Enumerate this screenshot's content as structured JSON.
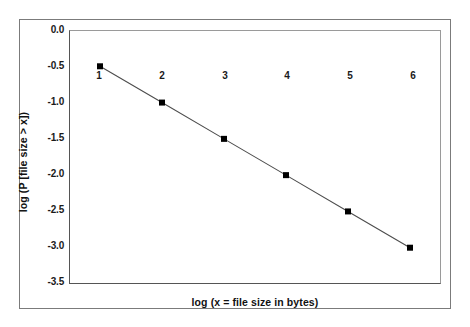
{
  "chart_data": {
    "type": "line",
    "title": "",
    "xlabel": "log (x = file size in bytes)",
    "ylabel": "log (P [file size > x])",
    "x": [
      1,
      2,
      3,
      4,
      5,
      6
    ],
    "values": [
      -0.5,
      -1.0,
      -1.5,
      -2.0,
      -2.5,
      -3.0
    ],
    "series": [
      {
        "name": "log complementary CDF of file size",
        "values": [
          -0.5,
          -1.0,
          -1.5,
          -2.0,
          -2.5,
          -3.0
        ]
      }
    ],
    "xlim": [
      0.5,
      6.5
    ],
    "ylim": [
      -3.5,
      0.0
    ],
    "xticks": [
      1,
      2,
      3,
      4,
      5,
      6
    ],
    "xtick_labels": [
      "1",
      "2",
      "3",
      "4",
      "5",
      "6"
    ],
    "yticks": [
      0.0,
      -0.5,
      -1.0,
      -1.5,
      -2.0,
      -2.5,
      -3.0,
      -3.5
    ],
    "ytick_labels": [
      "0.0",
      "-0.5",
      "-1.0",
      "-1.5",
      "-2.0",
      "-2.5",
      "-3.0",
      "-3.5"
    ],
    "grid": false,
    "legend": false,
    "legend_position": "none",
    "marker": "filled-square",
    "marker_color": "#000000",
    "line_color": "#4d4d4d",
    "axis_color": "#555555",
    "frame_color": "#7b7b7b",
    "background_color": "#ffffff",
    "xtick_label_position": "inside-top",
    "annotations": []
  }
}
